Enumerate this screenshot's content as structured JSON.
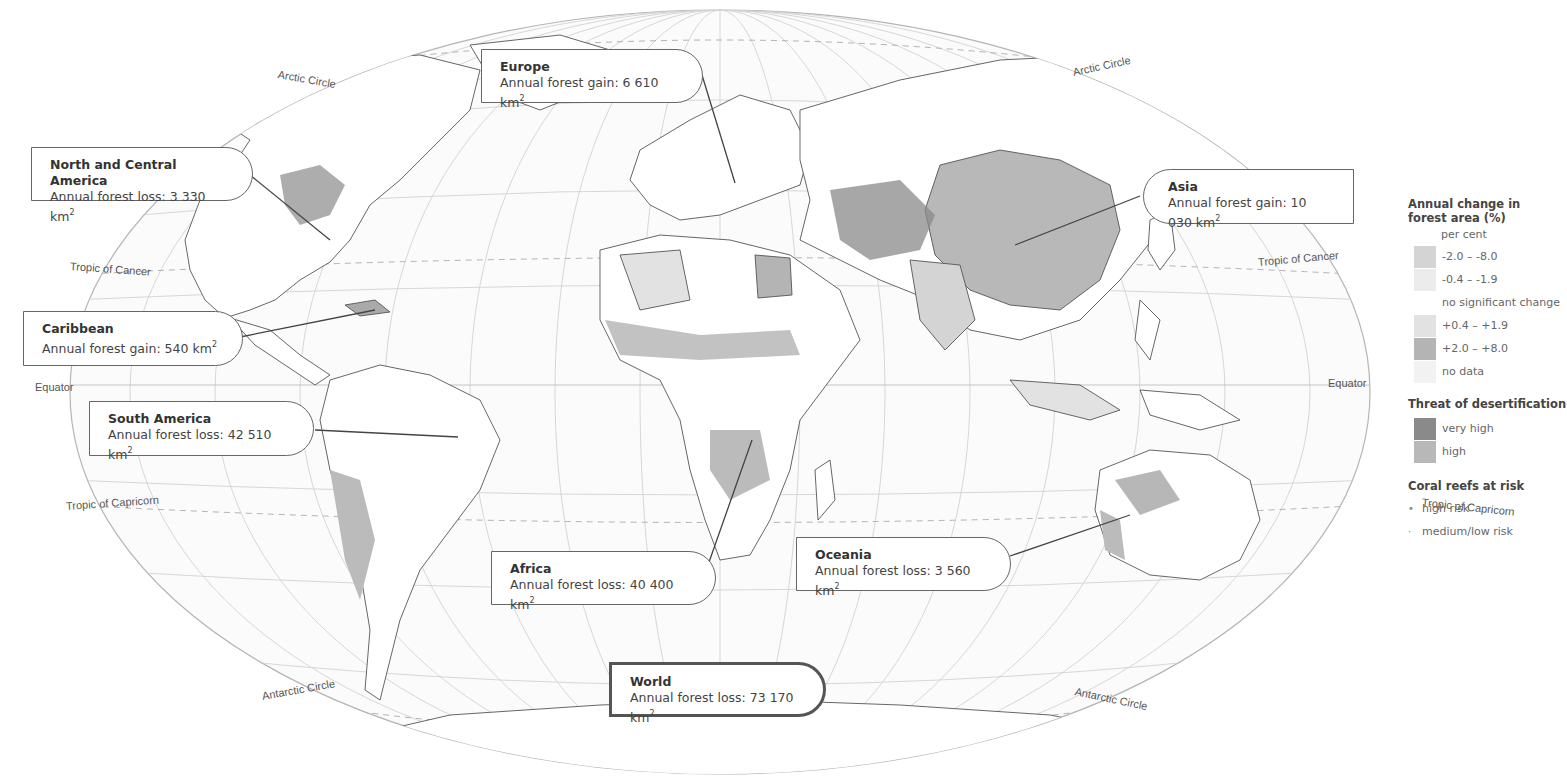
{
  "title": "",
  "map": {
    "projection": "Winkel Tripel world map",
    "reference_lines": {
      "arctic_circle": "Arctic Circle",
      "tropic_of_cancer": "Tropic of Cancer",
      "equator": "Equator",
      "tropic_of_capricorn": "Tropic of Capricorn",
      "antarctic_circle": "Antarctic Circle"
    },
    "colors": {
      "ocean": "#ffffff",
      "land_no_change": "#ffffff",
      "loss_high": "#d4d4d4",
      "loss_low": "#ececec",
      "gain_low": "#e2e2e2",
      "gain_high": "#b4b4b4",
      "no_data": "#f2f2f2",
      "desert_very_high": "#8a8a8a",
      "desert_high": "#b8b8b8",
      "border": "#555555",
      "graticule": "#c8c8c8"
    }
  },
  "callouts": [
    {
      "id": "north-central-america",
      "region": "North and Central America",
      "label": "Annual forest loss:",
      "value": "3 330",
      "unit": "km",
      "exp": "2"
    },
    {
      "id": "europe",
      "region": "Europe",
      "label": "Annual forest gain:",
      "value": "6 610",
      "unit": "km",
      "exp": "2"
    },
    {
      "id": "asia",
      "region": "Asia",
      "label": "Annual forest gain:",
      "value": "10 030",
      "unit": "km",
      "exp": "2"
    },
    {
      "id": "caribbean",
      "region": "Caribbean",
      "label": "Annual forest gain:",
      "value": "540",
      "unit": "km",
      "exp": "2"
    },
    {
      "id": "south-america",
      "region": "South America",
      "label": "Annual forest loss:",
      "value": "42 510",
      "unit": "km",
      "exp": "2"
    },
    {
      "id": "africa",
      "region": "Africa",
      "label": "Annual forest loss:",
      "value": "40 400",
      "unit": "km",
      "exp": "2"
    },
    {
      "id": "oceania",
      "region": "Oceania",
      "label": "Annual forest loss:",
      "value": "3 560",
      "unit": "km",
      "exp": "2"
    },
    {
      "id": "world",
      "region": "World",
      "label": "Annual forest loss:",
      "value": "73 170",
      "unit": "km",
      "exp": "2"
    }
  ],
  "legend": {
    "forest_change": {
      "title_line1": "Annual change in",
      "title_line2": "forest area (%)",
      "unit": "per cent",
      "items": [
        {
          "label": "-2.0 – -8.0",
          "color": "#d4d4d4"
        },
        {
          "label": "-0.4 – -1.9",
          "color": "#ececec"
        },
        {
          "label": "no significant change",
          "color": null
        },
        {
          "label": "+0.4 – +1.9",
          "color": "#e2e2e2"
        },
        {
          "label": "+2.0 – +8.0",
          "color": "#b4b4b4"
        },
        {
          "label": "no data",
          "color": "#f2f2f2"
        }
      ]
    },
    "desertification": {
      "title": "Threat of desertification",
      "items": [
        {
          "label": "very high",
          "color": "#8a8a8a"
        },
        {
          "label": "high",
          "color": "#b8b8b8"
        }
      ]
    },
    "coral_reefs": {
      "title": "Coral reefs at risk",
      "items": [
        {
          "label": "high risk",
          "marker": "•"
        },
        {
          "label": "medium/low risk",
          "marker": "·"
        }
      ]
    }
  }
}
